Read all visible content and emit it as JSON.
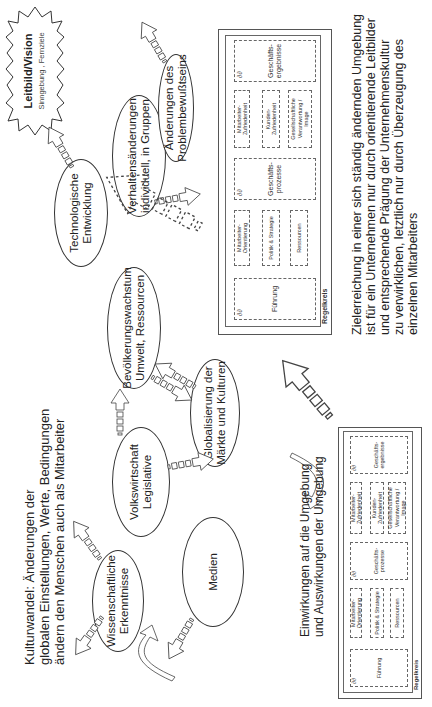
{
  "vision": {
    "title": "Leitbild/Vision",
    "subtitle": "Sinngebung , Fernziele"
  },
  "culture_change": {
    "lines": [
      "Kulturwandel:  Änderungen der",
      "globalen Einstellungen, Werte, Bedingungen",
      "ändern den Menschen auch als Mitarbeiter"
    ]
  },
  "factors": [
    {
      "id": "wissenschaft",
      "line1": "Wissenschaftliche",
      "line2": "Erkenntnisse"
    },
    {
      "id": "medien",
      "line1": "Medien",
      "line2": ""
    },
    {
      "id": "volkswirtschaft",
      "line1": "Volkswirtschaft",
      "line2": "Legislative"
    },
    {
      "id": "globalisierung",
      "line1": "Globalisierung der",
      "line2": "Märkte und Kulturen"
    },
    {
      "id": "bevoelkerung",
      "line1": "Bevölkerungswachstum",
      "line2": "Umwelt, Ressourcen"
    },
    {
      "id": "technologie",
      "line1": "Technologische",
      "line2": "Entwicklung"
    },
    {
      "id": "verhalten",
      "line1": "Verhaltensänderungen",
      "line2": "individuell, in Gruppen"
    },
    {
      "id": "problembewusstsein",
      "line1": "Änderungen des",
      "line2": "Problembewußtseins"
    }
  ],
  "interaction": {
    "lines": [
      "Einwirkungen auf die Umgebung",
      "und Auswirkungen der Umgebung"
    ]
  },
  "goal": {
    "lines": [
      "Zielerreichung in einer sich ständig ändernden Umgebung",
      "ist für ein Unternehmen nur durch orientierende Leitbilder",
      "und entsprechende Prägung der Unternehmenskultur",
      "zu verwirklichen, letztlich nur  durch Überzeugung des",
      "einzelnen Mitarbeiters"
    ]
  },
  "regelkreis": {
    "label": "Regelkreis",
    "symbol": "∂∂",
    "fuehrung": "Führung",
    "enablers": [
      "Mitarbeiter-\nOrientierung",
      "Politik & Strategie",
      "Ressourcen"
    ],
    "prozesse": "Geschäfts-\nprozesse",
    "results": [
      "Mitarbeiter-\nZufriedenheit",
      "Kunden-\nZufriedenheit",
      "Gesellschaftliche\nVerantwortung /\nImage"
    ],
    "ergebnisse": "Geschäfts-\nergebnisse"
  },
  "colors": {
    "line": "#333333",
    "text": "#222222",
    "background": "#ffffff"
  }
}
